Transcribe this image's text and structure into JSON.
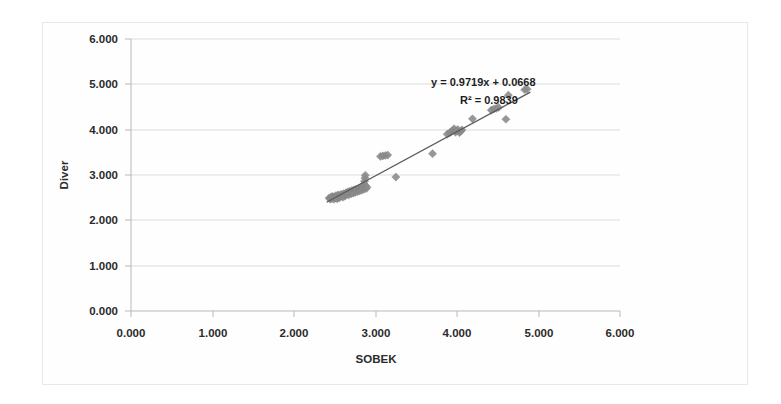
{
  "figure": {
    "background_color": "#ffffff",
    "border_color": "#e8e8e8",
    "marker_color": "#8c8c8c",
    "trendline_color": "#5a5a5a",
    "gridline_color": "#dcdcdc"
  },
  "chart_data": {
    "type": "scatter",
    "title": "",
    "subtitle": "",
    "xlabel": "SOBEK",
    "ylabel": "Diver",
    "xlim": [
      0.0,
      6.0
    ],
    "ylim": [
      0.0,
      6.0
    ],
    "xticks": [
      "0.000",
      "1.000",
      "2.000",
      "3.000",
      "4.000",
      "5.000",
      "6.000"
    ],
    "yticks": [
      "0.000",
      "1.000",
      "2.000",
      "3.000",
      "4.000",
      "5.000",
      "6.000"
    ],
    "xtick_values": [
      0,
      1,
      2,
      3,
      4,
      5,
      6
    ],
    "ytick_values": [
      0,
      1,
      2,
      3,
      4,
      5,
      6
    ],
    "grid": "horizontal",
    "legend": "none",
    "annotations": [
      {
        "text": "y = 0.9719x + 0.0668",
        "x": 3.45,
        "y": 5.35
      },
      {
        "text": "R² = 0.9839",
        "x": 3.7,
        "y": 5.05
      }
    ],
    "trendline": {
      "equation": "y = 0.9719x + 0.0668",
      "r_squared": "0.9839",
      "slope": 0.9719,
      "intercept": 0.0668,
      "x_start": 2.4,
      "x_end": 4.9
    },
    "series": [
      {
        "name": "SOBEK vs Diver",
        "marker": "diamond",
        "color": "#8c8c8c",
        "points": [
          [
            2.43,
            2.49
          ],
          [
            2.445,
            2.47
          ],
          [
            2.455,
            2.51
          ],
          [
            2.465,
            2.48
          ],
          [
            2.47,
            2.53
          ],
          [
            2.48,
            2.5
          ],
          [
            2.49,
            2.465
          ],
          [
            2.495,
            2.52
          ],
          [
            2.505,
            2.495
          ],
          [
            2.515,
            2.545
          ],
          [
            2.52,
            2.505
          ],
          [
            2.53,
            2.475
          ],
          [
            2.54,
            2.56
          ],
          [
            2.545,
            2.52
          ],
          [
            2.555,
            2.495
          ],
          [
            2.565,
            2.555
          ],
          [
            2.575,
            2.53
          ],
          [
            2.58,
            2.575
          ],
          [
            2.59,
            2.545
          ],
          [
            2.6,
            2.51
          ],
          [
            2.61,
            2.59
          ],
          [
            2.615,
            2.56
          ],
          [
            2.625,
            2.535
          ],
          [
            2.635,
            2.6
          ],
          [
            2.645,
            2.57
          ],
          [
            2.655,
            2.625
          ],
          [
            2.66,
            2.595
          ],
          [
            2.67,
            2.56
          ],
          [
            2.68,
            2.64
          ],
          [
            2.69,
            2.61
          ],
          [
            2.7,
            2.585
          ],
          [
            2.71,
            2.655
          ],
          [
            2.715,
            2.625
          ],
          [
            2.725,
            2.6
          ],
          [
            2.735,
            2.67
          ],
          [
            2.745,
            2.64
          ],
          [
            2.75,
            2.615
          ],
          [
            2.76,
            2.685
          ],
          [
            2.77,
            2.66
          ],
          [
            2.78,
            2.63
          ],
          [
            2.79,
            2.7
          ],
          [
            2.795,
            2.675
          ],
          [
            2.805,
            2.65
          ],
          [
            2.815,
            2.72
          ],
          [
            2.82,
            2.695
          ],
          [
            2.83,
            2.665
          ],
          [
            2.84,
            2.745
          ],
          [
            2.845,
            2.71
          ],
          [
            2.855,
            2.685
          ],
          [
            2.86,
            2.795
          ],
          [
            2.865,
            2.86
          ],
          [
            2.87,
            2.935
          ],
          [
            2.875,
            2.995
          ],
          [
            2.88,
            2.76
          ],
          [
            2.885,
            2.7
          ],
          [
            2.895,
            2.73
          ],
          [
            3.06,
            3.41
          ],
          [
            3.09,
            3.42
          ],
          [
            3.12,
            3.43
          ],
          [
            3.15,
            3.44
          ],
          [
            3.25,
            2.955
          ],
          [
            3.7,
            3.47
          ],
          [
            3.88,
            3.9
          ],
          [
            3.91,
            3.93
          ],
          [
            3.93,
            3.96
          ],
          [
            3.95,
            3.985
          ],
          [
            3.965,
            4.02
          ],
          [
            3.98,
            3.945
          ],
          [
            3.995,
            3.975
          ],
          [
            4.01,
            4.0
          ],
          [
            4.03,
            3.935
          ],
          [
            4.045,
            3.965
          ],
          [
            4.06,
            3.995
          ],
          [
            4.19,
            4.24
          ],
          [
            4.42,
            4.43
          ],
          [
            4.45,
            4.455
          ],
          [
            4.48,
            4.47
          ],
          [
            4.51,
            4.49
          ],
          [
            4.6,
            4.23
          ],
          [
            4.63,
            4.76
          ],
          [
            4.83,
            4.88
          ],
          [
            4.86,
            4.895
          ]
        ]
      }
    ]
  },
  "axis": {
    "x_title": "SOBEK",
    "y_title": "Diver"
  }
}
